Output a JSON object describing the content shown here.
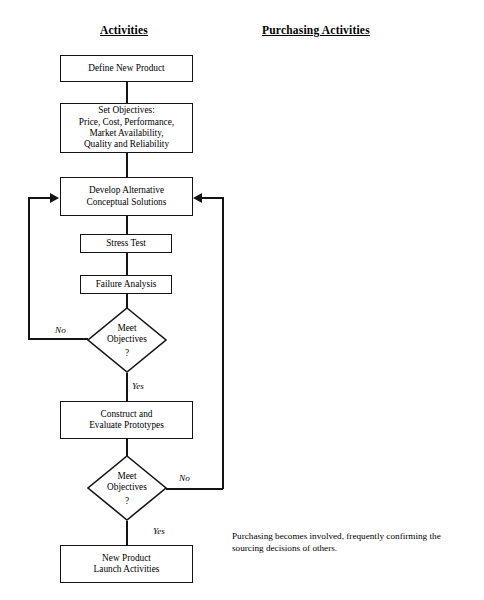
{
  "headers": {
    "activities": "Activities",
    "purchasing": "Purchasing Activities"
  },
  "nodes": {
    "define": "Define New Product",
    "objectives_line1": "Set Objectives:",
    "objectives_line2": "Price, Cost, Performance,",
    "objectives_line3": "Market Availability,",
    "objectives_line4": "Quality and Reliability",
    "develop_line1": "Develop Alternative",
    "develop_line2": "Conceptual Solutions",
    "stress_test": "Stress Test",
    "failure_analysis": "Failure Analysis",
    "construct_line1": "Construct and",
    "construct_line2": "Evaluate Prototypes",
    "launch_line1": "New Product",
    "launch_line2": "Launch Activities"
  },
  "decisions": {
    "first": {
      "line1": "Meet",
      "line2": "Objectives",
      "mark": "?"
    },
    "second": {
      "line1": "Meet",
      "line2": "Objectives",
      "mark": "?"
    }
  },
  "branch_labels": {
    "no_1": "No",
    "yes_1": "Yes",
    "no_2": "No",
    "yes_2": "Yes"
  },
  "notes": {
    "purchasing": "Purchasing becomes involved, frequently confirming the sourcing decisions of others."
  },
  "colors": {
    "stroke": "#141414",
    "background": "#ffffff",
    "text": "#000000"
  }
}
